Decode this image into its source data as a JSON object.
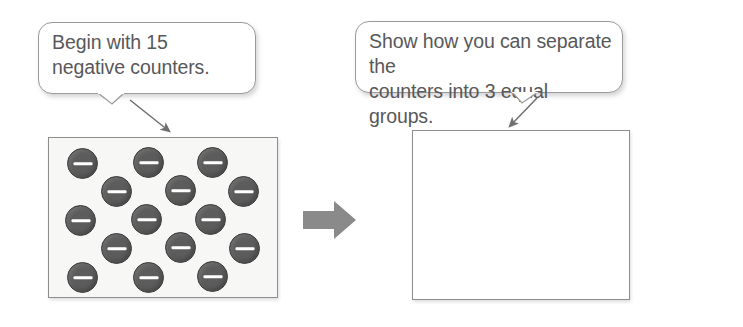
{
  "illustration": {
    "title": "Dividing integers with negative counters",
    "colors": {
      "counter_fill": "#5c5c5c",
      "counter_stroke": "#3e3e3e",
      "counter_sign": "#ffffff",
      "panel_border": "#8d8d8d",
      "left_panel_fill": "#f7f7f5",
      "right_panel_fill": "#ffffff",
      "callout_border": "#9a9a9a",
      "text": "#58585a",
      "block_arrow": "#8a8a8a",
      "leader_arrow": "#6f6f6f"
    }
  },
  "callouts": [
    {
      "id": "begin",
      "text": "Begin with 15\nnegative counters.",
      "lines": [
        "Begin with 15",
        "negative counters."
      ],
      "points_to": "left-counter-panel"
    },
    {
      "id": "separate",
      "text": "Show how you can separate the\ncounters into 3 equal groups.",
      "lines": [
        "Show how you can separate the",
        "counters into 3 equal groups."
      ],
      "points_to": "right-empty-panel"
    }
  ],
  "panels": {
    "left": {
      "name": "counter-panel",
      "counter_count": 15,
      "counter_sign": "negative",
      "rows": [
        3,
        3,
        3,
        3,
        3
      ],
      "counters": [
        {
          "x": 18,
          "y": 10,
          "sign": "-"
        },
        {
          "x": 84,
          "y": 9,
          "sign": "-"
        },
        {
          "x": 148,
          "y": 9,
          "sign": "-"
        },
        {
          "x": 52,
          "y": 38,
          "sign": "-"
        },
        {
          "x": 116,
          "y": 37,
          "sign": "-"
        },
        {
          "x": 179,
          "y": 38,
          "sign": "-"
        },
        {
          "x": 16,
          "y": 67,
          "sign": "-"
        },
        {
          "x": 82,
          "y": 66,
          "sign": "-"
        },
        {
          "x": 146,
          "y": 66,
          "sign": "-"
        },
        {
          "x": 52,
          "y": 95,
          "sign": "-"
        },
        {
          "x": 116,
          "y": 94,
          "sign": "-"
        },
        {
          "x": 180,
          "y": 95,
          "sign": "-"
        },
        {
          "x": 18,
          "y": 124,
          "sign": "-"
        },
        {
          "x": 84,
          "y": 124,
          "sign": "-"
        },
        {
          "x": 148,
          "y": 123,
          "sign": "-"
        }
      ]
    },
    "right": {
      "name": "answer-panel",
      "counter_count": 0,
      "empty": true
    }
  },
  "flow": {
    "arrow_label": "leads to",
    "direction": "right"
  }
}
